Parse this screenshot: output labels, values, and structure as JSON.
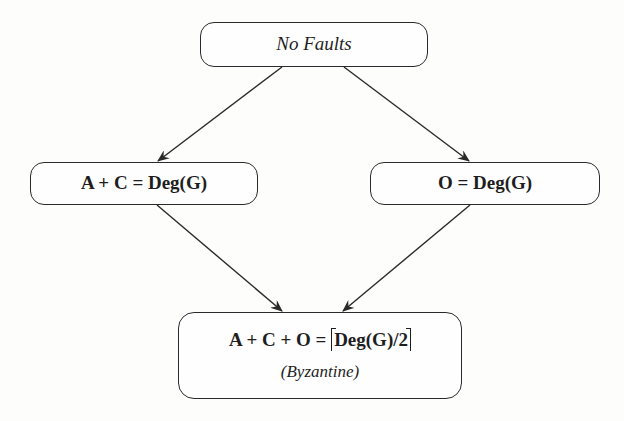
{
  "diagram": {
    "type": "flow-diagram",
    "nodes": {
      "top": {
        "label": "No Faults"
      },
      "left": {
        "label": "A + C = Deg(G)"
      },
      "right": {
        "label": "O = Deg(G)"
      },
      "bottom": {
        "label_prefix": "A + C + O = ",
        "label_ceil": "Deg(G)/2",
        "sublabel": "(Byzantine)"
      }
    },
    "edges": [
      {
        "from": "No Faults",
        "to": "A + C = Deg(G)"
      },
      {
        "from": "No Faults",
        "to": "O = Deg(G)"
      },
      {
        "from": "A + C = Deg(G)",
        "to": "A + C + O = ⌈Deg(G)/2⌉ (Byzantine)"
      },
      {
        "from": "O = Deg(G)",
        "to": "A + C + O = ⌈Deg(G)/2⌉ (Byzantine)"
      }
    ],
    "colors": {
      "stroke": "#2a2a2a",
      "text": "#1e1e1e",
      "background": "#fdfdfc"
    }
  }
}
